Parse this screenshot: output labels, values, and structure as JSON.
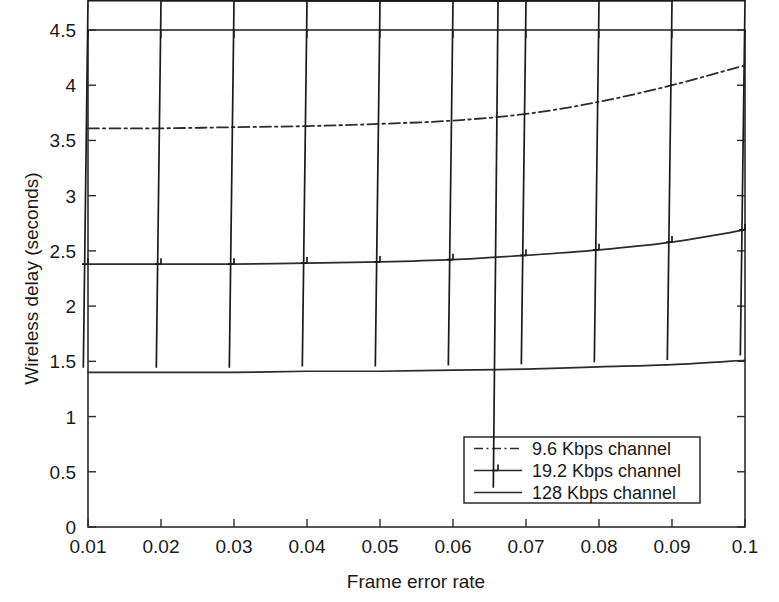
{
  "chart_data": {
    "type": "line",
    "title": "",
    "subtitle": "",
    "xlabel": "Frame error rate",
    "ylabel": "Wireless delay (seconds)",
    "x": [
      0.01,
      0.02,
      0.03,
      0.04,
      0.05,
      0.06,
      0.07,
      0.08,
      0.09,
      0.1
    ],
    "xticklabels": [
      "0.01",
      "0.02",
      "0.03",
      "0.04",
      "0.05",
      "0.06",
      "0.07",
      "0.08",
      "0.09",
      "0.1"
    ],
    "yticks": [
      0,
      0.5,
      1,
      1.5,
      2,
      2.5,
      3,
      3.5,
      4,
      4.5
    ],
    "yticklabels": [
      "0",
      "0.5",
      "1",
      "1.5",
      "2",
      "2.5",
      "3",
      "3.5",
      "4",
      "4.5"
    ],
    "xlim": [
      0.01,
      0.1
    ],
    "ylim": [
      0,
      4.5
    ],
    "grid": false,
    "legend_position": "lower right",
    "series": [
      {
        "name": "9.6 Kbps channel",
        "style": "dash-dot",
        "marker": "none",
        "color": "#2b2b2b",
        "values": [
          3.61,
          3.61,
          3.62,
          3.63,
          3.65,
          3.68,
          3.74,
          3.85,
          4.0,
          4.18
        ]
      },
      {
        "name": "19.2 Kbps channel",
        "style": "solid",
        "marker": "plus",
        "color": "#2b2b2b",
        "values": [
          2.38,
          2.38,
          2.38,
          2.39,
          2.4,
          2.42,
          2.46,
          2.51,
          2.58,
          2.69
        ]
      },
      {
        "name": "128 Kbps channel",
        "style": "solid",
        "marker": "cross",
        "color": "#2b2b2b",
        "values": [
          1.4,
          1.4,
          1.4,
          1.41,
          1.41,
          1.42,
          1.43,
          1.45,
          1.47,
          1.51
        ]
      }
    ]
  },
  "legend": {
    "entries": [
      {
        "label": "9.6 Kbps channel"
      },
      {
        "label": "19.2 Kbps channel"
      },
      {
        "label": "128 Kbps channel"
      }
    ]
  },
  "axes": {
    "x_title": "Frame error rate",
    "y_title": "Wireless delay (seconds)"
  }
}
